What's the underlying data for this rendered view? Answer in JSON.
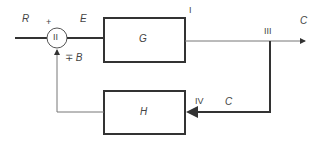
{
  "diagram": {
    "type": "feedback-control-block-diagram",
    "signals": {
      "input": "R",
      "error": "E",
      "output": "C",
      "feedback_output": "C",
      "feedback_signal": "B",
      "feedback_sign": "∓",
      "input_sign": "+"
    },
    "blocks": {
      "forward": "G",
      "feedback": "H"
    },
    "summing_junction": "II",
    "points": {
      "p1": "I",
      "p3": "III",
      "p4": "IV"
    },
    "colors": {
      "line": "#333333",
      "thin_line": "#777777",
      "text": "#444444"
    }
  }
}
